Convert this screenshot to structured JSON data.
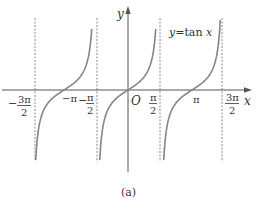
{
  "chart_data": {
    "type": "line",
    "title": "",
    "function_label": "y=tan x",
    "caption": "(a)",
    "xlabel": "x",
    "ylabel": "y",
    "origin_label": "O",
    "x_ticks": [
      {
        "value": -4.712,
        "label_num": "3π",
        "label_den": "2",
        "sign": "−"
      },
      {
        "value": -3.1416,
        "label": "−π"
      },
      {
        "value": -1.5708,
        "label_num": "π",
        "label_den": "2",
        "sign": "−"
      },
      {
        "value": 1.5708,
        "label_num": "π",
        "label_den": "2",
        "sign": ""
      },
      {
        "value": 3.1416,
        "label": "π"
      },
      {
        "value": 4.712,
        "label_num": "3π",
        "label_den": "2",
        "sign": ""
      }
    ],
    "asymptotes": [
      -4.712,
      -1.5708,
      1.5708,
      4.712
    ],
    "branches": [
      {
        "center": -3.1416,
        "from": -4.712,
        "to": -1.5708
      },
      {
        "center": 0,
        "from": -1.5708,
        "to": 1.5708
      },
      {
        "center": 3.1416,
        "from": 1.5708,
        "to": 4.712
      }
    ],
    "series": [
      {
        "name": "y=tan x",
        "function": "tan"
      }
    ],
    "xlim": [
      -5.6,
      5.3
    ],
    "ylim": [
      -5.5,
      5.5
    ],
    "grid": false,
    "legend": "none",
    "colors": {
      "curve": "#858585",
      "axis": "#555555",
      "asymptote": "#888888",
      "text": "#333333"
    }
  },
  "labels": {
    "y_axis": "y",
    "x_axis": "x",
    "origin": "O",
    "function": "y=tan",
    "function_var": "x",
    "caption": "(a)",
    "neg_pi": "−π",
    "pi": "π",
    "minus": "−",
    "pi_num": "π",
    "three_pi_num": "3π",
    "den": "2"
  }
}
